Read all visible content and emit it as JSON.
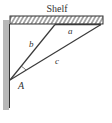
{
  "diagram": {
    "title": "Shelf",
    "labels": {
      "a": "a",
      "b": "b",
      "c": "c",
      "point": "A"
    },
    "colors": {
      "line": "#3a3a3a",
      "wall": "#b8b8b8",
      "hatch": "#444444"
    }
  }
}
